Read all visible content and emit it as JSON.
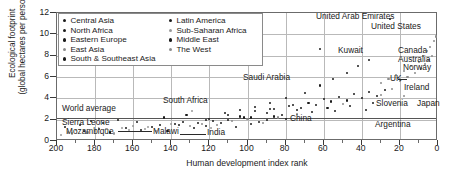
{
  "chart_data": {
    "type": "scatter",
    "title": "",
    "xlabel": "Human development index rank",
    "ylabel": "Ecological footprint\n(global hectares per person)",
    "xlim": [
      200,
      0
    ],
    "ylim": [
      0,
      12
    ],
    "xticks": [
      200,
      180,
      160,
      140,
      120,
      100,
      80,
      60,
      40,
      20,
      0
    ],
    "yticks": [
      0,
      2,
      4,
      6,
      8,
      10,
      12
    ],
    "grid": true,
    "legend_position": "top-left-inside",
    "world_average": 2.2,
    "series": [
      {
        "name": "Central Asia",
        "color": "#1b1b1b",
        "marker": "dot",
        "points": [
          [
            196,
            1.3
          ],
          [
            188,
            1.5
          ],
          [
            182,
            1.9
          ],
          [
            176,
            1.7
          ],
          [
            168,
            2.0
          ],
          [
            158,
            1.8
          ],
          [
            144,
            2.2
          ],
          [
            132,
            2.4
          ],
          [
            120,
            2.1
          ],
          [
            112,
            2.6
          ],
          [
            104,
            2.3
          ],
          [
            96,
            2.8
          ],
          [
            88,
            3.0
          ],
          [
            76,
            3.4
          ]
        ]
      },
      {
        "name": "North Africa",
        "color": "#1b1b1b",
        "marker": "dot",
        "points": [
          [
            138,
            1.6
          ],
          [
            126,
            1.7
          ],
          [
            118,
            1.9
          ],
          [
            110,
            2.0
          ],
          [
            102,
            2.2
          ],
          [
            94,
            1.8
          ],
          [
            86,
            2.3
          ],
          [
            80,
            2.1
          ]
        ]
      },
      {
        "name": "Eastern Europe",
        "color": "#1b1b1b",
        "marker": "dot",
        "points": [
          [
            86,
            3.0
          ],
          [
            78,
            3.3
          ],
          [
            72,
            3.1
          ],
          [
            68,
            3.6
          ],
          [
            64,
            3.4
          ],
          [
            60,
            3.9
          ],
          [
            56,
            3.7
          ],
          [
            52,
            4.1
          ],
          [
            48,
            3.8
          ],
          [
            44,
            4.4
          ],
          [
            40,
            4.0
          ],
          [
            36,
            4.6
          ],
          [
            32,
            4.2
          ],
          [
            28,
            4.8
          ]
        ]
      },
      {
        "name": "East Asia",
        "color": "#8c8c8c",
        "marker": "dot",
        "points": [
          [
            130,
            1.4
          ],
          [
            124,
            1.6
          ],
          [
            116,
            1.5
          ],
          [
            108,
            1.9
          ],
          [
            100,
            2.1
          ],
          [
            92,
            1.7
          ],
          [
            84,
            2.2
          ],
          [
            74,
            2.5
          ],
          [
            50,
            3.5
          ],
          [
            30,
            4.3
          ],
          [
            24,
            4.9
          ],
          [
            18,
            4.2
          ]
        ]
      },
      {
        "name": "South & Southeast Asia",
        "color": "#1b1b1b",
        "marker": "dot",
        "points": [
          [
            186,
            0.9
          ],
          [
            178,
            1.1
          ],
          [
            172,
            0.8
          ],
          [
            164,
            1.2
          ],
          [
            156,
            1.0
          ],
          [
            150,
            1.3
          ],
          [
            142,
            0.9
          ],
          [
            136,
            1.5
          ],
          [
            128,
            1.2
          ],
          [
            122,
            1.4
          ],
          [
            114,
            1.7
          ],
          [
            106,
            1.3
          ],
          [
            98,
            1.6
          ],
          [
            90,
            2.0
          ]
        ]
      },
      {
        "name": "Latin America",
        "color": "#1b1b1b",
        "marker": "dot",
        "points": [
          [
            146,
            1.5
          ],
          [
            134,
            1.8
          ],
          [
            122,
            2.0
          ],
          [
            110,
            2.4
          ],
          [
            98,
            2.2
          ],
          [
            90,
            2.6
          ],
          [
            82,
            2.4
          ],
          [
            74,
            2.9
          ],
          [
            66,
            2.7
          ],
          [
            58,
            3.1
          ],
          [
            54,
            2.8
          ],
          [
            46,
            3.3
          ],
          [
            38,
            2.9
          ],
          [
            34,
            3.6
          ]
        ]
      },
      {
        "name": "Sub-Saharan Africa",
        "color": "#9a9a9a",
        "marker": "dot",
        "points": [
          [
            198,
            0.6
          ],
          [
            194,
            0.8
          ],
          [
            192,
            0.7
          ],
          [
            190,
            1.0
          ],
          [
            184,
            0.8
          ],
          [
            180,
            0.9
          ],
          [
            174,
            1.1
          ],
          [
            170,
            0.7
          ],
          [
            166,
            1.2
          ],
          [
            162,
            1.0
          ],
          [
            160,
            1.4
          ],
          [
            154,
            1.1
          ],
          [
            152,
            1.3
          ],
          [
            148,
            0.9
          ],
          [
            140,
            1.6
          ],
          [
            129,
            2.8
          ],
          [
            119,
            1.2
          ]
        ]
      },
      {
        "name": "Middle East",
        "color": "#1b1b1b",
        "marker": "dot",
        "points": [
          [
            104,
            2.9
          ],
          [
            96,
            3.2
          ],
          [
            88,
            3.6
          ],
          [
            80,
            4.0
          ],
          [
            70,
            4.5
          ],
          [
            62,
            5.2
          ],
          [
            55,
            5.8
          ],
          [
            48,
            6.4
          ],
          [
            42,
            7.0
          ],
          [
            36,
            7.6
          ],
          [
            25,
            11.4
          ],
          [
            62,
            8.6
          ]
        ]
      },
      {
        "name": "The West",
        "color": "#8c8c8c",
        "marker": "dot",
        "points": [
          [
            30,
            5.4
          ],
          [
            26,
            5.8
          ],
          [
            22,
            6.2
          ],
          [
            20,
            5.6
          ],
          [
            18,
            6.6
          ],
          [
            16,
            6.0
          ],
          [
            14,
            7.0
          ],
          [
            12,
            6.4
          ],
          [
            10,
            7.4
          ],
          [
            9,
            6.8
          ],
          [
            8,
            8.0
          ],
          [
            7,
            7.2
          ],
          [
            6,
            8.4
          ],
          [
            5,
            7.6
          ],
          [
            4,
            8.8
          ],
          [
            3,
            8.0
          ],
          [
            2,
            9.4
          ],
          [
            1,
            9.8
          ]
        ]
      }
    ],
    "annotations": [
      {
        "label": "United Arab Emirates",
        "x": 36,
        "y": 11.6
      },
      {
        "label": "United States",
        "x": 10,
        "y": 10.5
      },
      {
        "label": "Kuwait",
        "x": 52,
        "y": 8.9
      },
      {
        "label": "Canada",
        "x": 8,
        "y": 8.9
      },
      {
        "label": "Australia",
        "x": 6,
        "y": 8.1
      },
      {
        "label": "Norway",
        "x": 5,
        "y": 7.4
      },
      {
        "label": "Saudi Arabia",
        "x": 78,
        "y": 5.9
      },
      {
        "label": "UK",
        "x": 20,
        "y": 5.9
      },
      {
        "label": "Ireland",
        "x": 8,
        "y": 5.2
      },
      {
        "label": "Slovenia",
        "x": 30,
        "y": 3.5
      },
      {
        "label": "Japan",
        "x": 12,
        "y": 3.5
      },
      {
        "label": "South Africa",
        "x": 124,
        "y": 4.0
      },
      {
        "label": "China",
        "x": 74,
        "y": 2.4
      },
      {
        "label": "Argentina",
        "x": 38,
        "y": 1.5
      },
      {
        "label": "World average",
        "x": 186,
        "y": 2.6
      },
      {
        "label": "Sierra Leone",
        "x": 190,
        "y": 1.5
      },
      {
        "label": "Mozambique",
        "x": 186,
        "y": 0.7
      },
      {
        "label": "Malawi",
        "x": 124,
        "y": 0.7
      },
      {
        "label": "India",
        "x": 112,
        "y": 0.6
      }
    ]
  },
  "axes": {
    "ylabel": "Ecological footprint\n(global hectares per person)",
    "xlabel": "Human development index rank",
    "yticks": [
      "0",
      "2",
      "4",
      "6",
      "8",
      "10",
      "12"
    ],
    "xticks": [
      "200",
      "180",
      "160",
      "140",
      "120",
      "100",
      "80",
      "60",
      "40",
      "20",
      "0"
    ]
  },
  "legend": {
    "column1": [
      {
        "label": "Central Asia",
        "color": "#1b1b1b"
      },
      {
        "label": "North Africa",
        "color": "#1b1b1b"
      },
      {
        "label": "Eastern Europe",
        "color": "#1b1b1b"
      },
      {
        "label": "East Asia",
        "color": "#8c8c8c"
      },
      {
        "label": "South & Southeast Asia",
        "color": "#1b1b1b"
      }
    ],
    "column2": [
      {
        "label": "Latin America",
        "color": "#1b1b1b"
      },
      {
        "label": "Sub-Saharan Africa",
        "color": "#9a9a9a"
      },
      {
        "label": "Middle East",
        "color": "#1b1b1b"
      },
      {
        "label": "The West",
        "color": "#8c8c8c"
      }
    ]
  },
  "colors": {
    "frame": "#6b6b6b",
    "grid": "#b9b9b9",
    "text": "#1a1a1a",
    "marker_dark": "#1b1b1b",
    "marker_light": "#9a9a9a"
  }
}
